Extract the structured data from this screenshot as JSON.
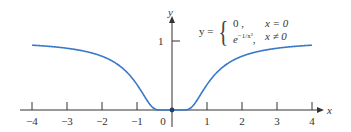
{
  "chart_data": {
    "type": "line",
    "title": "",
    "xlabel": "x",
    "ylabel": "y",
    "xlim": [
      -4,
      4
    ],
    "ylim": [
      0,
      1
    ],
    "x_ticks": [
      "-4",
      "-3",
      "-2",
      "-1",
      "0",
      "1",
      "2",
      "3",
      "4"
    ],
    "y_ticks": [
      "1"
    ],
    "grid": false,
    "legend": null,
    "annotation": {
      "lhs": "y =",
      "case1_expr": "0 ,",
      "case1_cond": "x = 0",
      "case2_expr": "e^{-1/x^2},",
      "case2_cond": "x ≠ 0"
    },
    "series": [
      {
        "name": "y = e^(-1/x^2)",
        "color": "#3a78c9",
        "x": [
          -4,
          -3.5,
          -3,
          -2.5,
          -2,
          -1.5,
          -1,
          -0.75,
          -0.5,
          -0.35,
          -0.25,
          0,
          0.25,
          0.35,
          0.5,
          0.75,
          1,
          1.5,
          2,
          2.5,
          3,
          3.5,
          4
        ],
        "values": [
          0.939,
          0.922,
          0.895,
          0.852,
          0.779,
          0.641,
          0.368,
          0.169,
          0.018,
          0.0003,
          0.0,
          0.0,
          0.0,
          0.0003,
          0.018,
          0.169,
          0.368,
          0.641,
          0.779,
          0.852,
          0.895,
          0.922,
          0.939
        ]
      }
    ],
    "marked_point": {
      "x": 0,
      "y": 0
    }
  },
  "labels": {
    "x_axis": "x",
    "y_axis": "y",
    "y_tick_1": "1",
    "x_ticks": [
      "−4",
      "−3",
      "−2",
      "−1",
      "0",
      "1",
      "2",
      "3",
      "4"
    ],
    "formula_lhs": "y =",
    "case1_expr": "0 ,",
    "case1_cond": "x = 0",
    "case2_base": "e",
    "case2_exp": "−1/x²",
    "case2_sep": ",",
    "case2_cond": "x ≠ 0"
  }
}
